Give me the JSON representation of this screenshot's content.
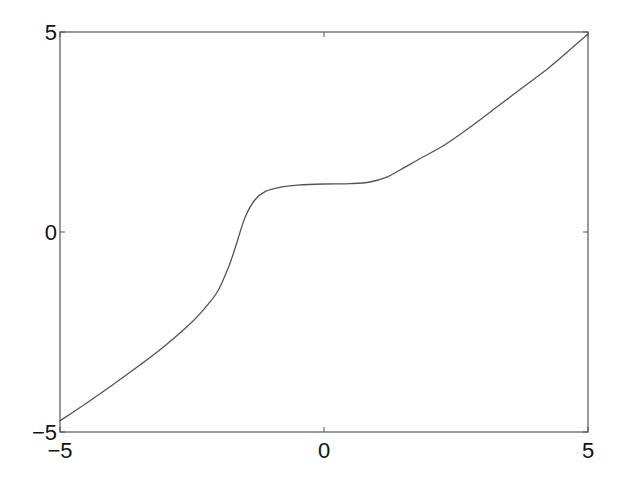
{
  "chart_data": {
    "type": "line",
    "title": "",
    "xlabel": "",
    "ylabel": "",
    "xlim": [
      -5,
      5
    ],
    "ylim": [
      -5,
      5
    ],
    "grid": false,
    "legend": null,
    "x_ticks": [
      -5,
      0,
      5
    ],
    "y_ticks": [
      -5,
      0,
      5
    ],
    "x_tick_labels": [
      "−5",
      "0",
      "5"
    ],
    "y_tick_labels": [
      "−5",
      "0",
      "5"
    ],
    "line_color": "#555555",
    "series": [
      {
        "name": "curve",
        "x": [
          -5.0,
          -4.5,
          -4.0,
          -3.5,
          -3.0,
          -2.5,
          -2.16,
          -2.0,
          -1.8,
          -1.67,
          -1.5,
          -1.31,
          -1.1,
          -0.83,
          -0.5,
          0.0,
          0.5,
          0.87,
          1.2,
          1.44,
          1.8,
          2.29,
          2.8,
          3.33,
          3.8,
          4.3,
          5.0
        ],
        "y": [
          -4.72,
          -4.28,
          -3.82,
          -3.34,
          -2.83,
          -2.25,
          -1.75,
          -1.45,
          -0.85,
          -0.35,
          0.35,
          0.8,
          1.02,
          1.12,
          1.17,
          1.2,
          1.21,
          1.25,
          1.38,
          1.55,
          1.82,
          2.18,
          2.65,
          3.18,
          3.65,
          4.15,
          4.95
        ]
      }
    ]
  }
}
